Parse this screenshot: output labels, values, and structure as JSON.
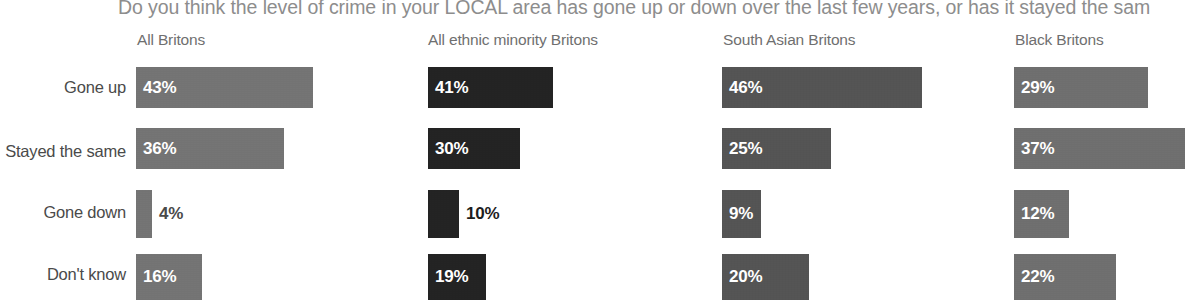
{
  "chart_data": {
    "type": "bar",
    "title": "Do you think the level of crime in your LOCAL area has gone up or down over the last few years, or has it stayed the sam",
    "xlabel": "",
    "ylabel": "",
    "grid": false,
    "legend": "none",
    "orientation": "horizontal",
    "value_suffix": "%",
    "xlim": [
      0,
      50
    ],
    "categories": [
      "Gone up",
      "Stayed the same",
      "Gone down",
      "Don't know"
    ],
    "series": [
      {
        "name": "All Britons",
        "color": "#757575",
        "values": [
          43,
          36,
          4,
          16
        ],
        "labels": [
          "43%",
          "36%",
          "4%",
          "16%"
        ],
        "label_position": [
          "inside",
          "inside",
          "outside",
          "inside"
        ],
        "outside_label_color": "#4a4a4a"
      },
      {
        "name": "All ethnic minority Britons",
        "color": "#242424",
        "values": [
          41,
          30,
          10,
          19
        ],
        "labels": [
          "41%",
          "30%",
          "10%",
          "19%"
        ],
        "label_position": [
          "inside",
          "inside",
          "outside",
          "inside"
        ],
        "outside_label_color": "#1d1d1d"
      },
      {
        "name": "South Asian Britons",
        "color": "#555555",
        "values": [
          46,
          25,
          9,
          20
        ],
        "labels": [
          "46%",
          "25%",
          "9%",
          "20%"
        ],
        "label_position": [
          "inside",
          "inside",
          "inside",
          "inside"
        ],
        "outside_label_color": "#4a4a4a"
      },
      {
        "name": "Black Britons",
        "color": "#707070",
        "values": [
          29,
          37,
          12,
          22
        ],
        "labels": [
          "29%",
          "37%",
          "12%",
          "22%"
        ],
        "label_position": [
          "inside",
          "inside",
          "inside",
          "inside"
        ],
        "outside_label_color": "#4a4a4a"
      }
    ]
  },
  "layout": {
    "columns": [
      {
        "header": "All Britons",
        "header_left": 137,
        "bar_left": 136,
        "px_per_unit": 4.12
      },
      {
        "header": "All ethnic minority Britons",
        "header_left": 428,
        "bar_left": 428,
        "px_per_unit": 3.05
      },
      {
        "header": "South Asian Britons",
        "header_left": 723,
        "bar_left": 722,
        "px_per_unit": 4.35
      },
      {
        "header": "Black Britons",
        "header_left": 1015,
        "bar_left": 1014,
        "px_per_unit": 4.62
      }
    ],
    "rows": [
      {
        "label": "Gone up",
        "label_top": 78,
        "bar_top": 67,
        "bar_height": 41
      },
      {
        "label": "Stayed the same",
        "label_top": 142,
        "bar_top": 128,
        "bar_height": 41
      },
      {
        "label": "Gone down",
        "label_top": 203,
        "bar_top": 190,
        "bar_height": 48
      },
      {
        "label": "Don't know",
        "label_top": 265,
        "bar_top": 254,
        "bar_height": 46
      }
    ]
  }
}
